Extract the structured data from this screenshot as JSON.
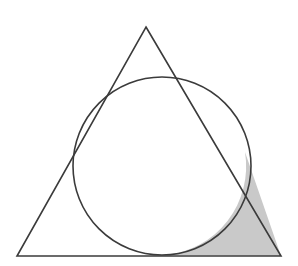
{
  "figure": {
    "caption": "",
    "background_color": "#ffffff",
    "canvas": {
      "width": 298,
      "height": 266
    }
  },
  "chart_data": {
    "type": "diagram",
    "xlabel": "",
    "ylabel": "",
    "grid": false,
    "legend": false,
    "coordinate_system": "pixels, origin top-left",
    "shapes": [
      {
        "name": "triangle",
        "kind": "polygon",
        "closed": true,
        "vertices": [
          {
            "label": "apex",
            "x": 146,
            "y": 27
          },
          {
            "label": "bottom-right",
            "x": 281,
            "y": 256
          },
          {
            "label": "bottom-left",
            "x": 17,
            "y": 256
          }
        ],
        "fill": "none",
        "stroke": "#3b3b3b",
        "stroke_width": 1.6
      },
      {
        "name": "inscribed-circle",
        "kind": "circle",
        "center": {
          "x": 162,
          "y": 166
        },
        "radius": 89,
        "fill": "none",
        "stroke": "#3b3b3b",
        "stroke_width": 1.6,
        "tangent_points": [
          {
            "label": "base-tangent",
            "x": 165,
            "y": 255
          },
          {
            "label": "right-side-tangent",
            "x": 245,
            "y": 152
          },
          {
            "label": "left-side-tangent",
            "x": 83,
            "y": 122
          }
        ]
      },
      {
        "name": "shaded-corner-region",
        "kind": "curvilinear-triangle",
        "description": "Region bounded by the right side of the triangle, the base, and the arc of the inscribed circle, at the bottom-right vertex",
        "fill": "#c9c9c9",
        "stroke": "none",
        "boundary_points": [
          {
            "label": "right-side-tangent",
            "x": 245,
            "y": 152
          },
          {
            "label": "bottom-right-vertex",
            "x": 281,
            "y": 256
          },
          {
            "label": "base-tangent",
            "x": 165,
            "y": 255
          }
        ]
      }
    ],
    "colors": {
      "stroke": "#3b3b3b",
      "shaded_fill": "#c9c9c9",
      "background": "#ffffff"
    }
  }
}
